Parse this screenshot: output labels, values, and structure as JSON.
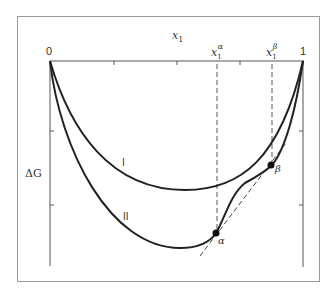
{
  "figure": {
    "x_axis_label": "x",
    "x_axis_label_sub": "1",
    "y_axis_label": "ΔG",
    "x_min_label": "0",
    "x_max_label": "1",
    "alpha_label": "x",
    "alpha_sub": "1",
    "alpha_sup": "α",
    "beta_label": "x",
    "beta_sub": "1",
    "beta_sup": "β",
    "curve_I_label": "I",
    "curve_II_label": "II",
    "point_alpha_label": "α",
    "point_beta_label": "β",
    "colors": {
      "curve": "#222222",
      "axis": "#555555",
      "frame": "#999999",
      "dashed": "#555555"
    }
  }
}
